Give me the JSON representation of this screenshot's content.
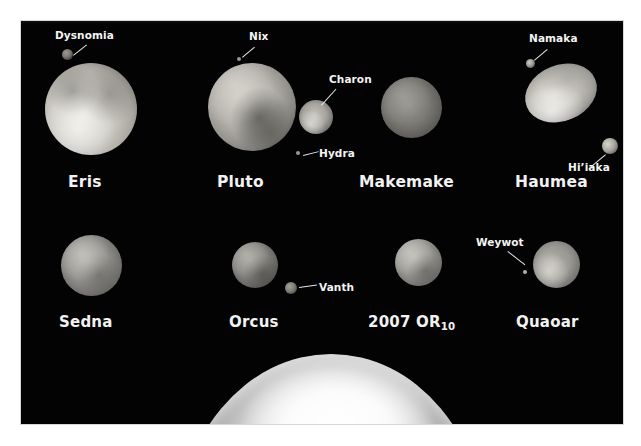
{
  "figure": {
    "background_color": "#ffffff",
    "panel_color": "#030303",
    "label_color": "#f2f2f2"
  },
  "rows": [
    {
      "row": 1,
      "bodies": [
        {
          "name": "Eris",
          "label": "Eris",
          "moons": [
            {
              "name": "Dysnomia",
              "label": "Dysnomia"
            }
          ]
        },
        {
          "name": "Pluto",
          "label": "Pluto",
          "moons": [
            {
              "name": "Nix",
              "label": "Nix"
            },
            {
              "name": "Charon",
              "label": "Charon"
            },
            {
              "name": "Hydra",
              "label": "Hydra"
            }
          ]
        },
        {
          "name": "Makemake",
          "label": "Makemake",
          "moons": []
        },
        {
          "name": "Haumea",
          "label": "Haumea",
          "moons": [
            {
              "name": "Namaka",
              "label": "Namaka"
            },
            {
              "name": "Hi'iaka",
              "label": "Hi’iaka"
            }
          ]
        }
      ]
    },
    {
      "row": 2,
      "bodies": [
        {
          "name": "Sedna",
          "label": "Sedna",
          "moons": []
        },
        {
          "name": "Orcus",
          "label": "Orcus",
          "moons": [
            {
              "name": "Vanth",
              "label": "Vanth"
            }
          ]
        },
        {
          "name": "2007 OR10",
          "label_prefix": "2007 OR",
          "label_sub": "10",
          "moons": []
        },
        {
          "name": "Quaoar",
          "label": "Quaoar",
          "moons": [
            {
              "name": "Weywot",
              "label": "Weywot"
            }
          ]
        }
      ]
    },
    {
      "row": 3,
      "bodies": [
        {
          "name": "Earth",
          "label": "",
          "moons": []
        }
      ]
    }
  ]
}
